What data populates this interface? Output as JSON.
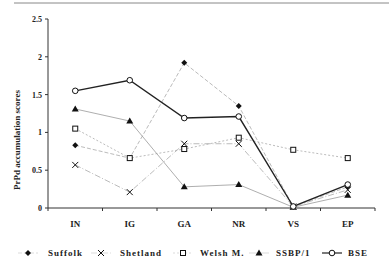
{
  "chart_data": {
    "type": "line",
    "title": "",
    "xlabel": "",
    "ylabel": "PrPd accumulation scores",
    "ylim": [
      0,
      2.5
    ],
    "yticks": [
      0,
      0.5,
      1,
      1.5,
      2,
      2.5
    ],
    "ytick_labels": [
      "0",
      "0.5",
      "1",
      "1.5",
      "2",
      "2.5"
    ],
    "grid": false,
    "legend_position": "bottom",
    "categories": [
      "IN",
      "IG",
      "GA",
      "NR",
      "VS",
      "EP"
    ],
    "series": [
      {
        "name": "Suffolk",
        "marker": "diamond",
        "line": "dashed",
        "color": "#aaaaaa",
        "values": [
          0.83,
          0.66,
          1.92,
          1.35,
          0.02,
          0.28
        ]
      },
      {
        "name": "Shetland",
        "marker": "x",
        "line": "dashdot",
        "color": "#aaaaaa",
        "values": [
          0.57,
          0.21,
          0.85,
          0.85,
          0.02,
          0.24
        ]
      },
      {
        "name": "Welsh M.",
        "marker": "square-open",
        "line": "dotted",
        "color": "#aaaaaa",
        "values": [
          1.05,
          0.66,
          0.78,
          0.93,
          0.77,
          0.66
        ]
      },
      {
        "name": "SSBP/1",
        "marker": "triangle",
        "line": "solid-thin",
        "color": "#999999",
        "values": [
          1.31,
          1.15,
          0.28,
          0.31,
          0.01,
          0.17
        ]
      },
      {
        "name": "BSE",
        "marker": "circle-open",
        "line": "solid-thick",
        "color": "#222222",
        "values": [
          1.55,
          1.69,
          1.19,
          1.21,
          0.02,
          0.31
        ]
      }
    ]
  },
  "legend": {
    "items": [
      "Suffolk",
      "Shetland",
      "Welsh M.",
      "SSBP/1",
      "BSE"
    ]
  }
}
